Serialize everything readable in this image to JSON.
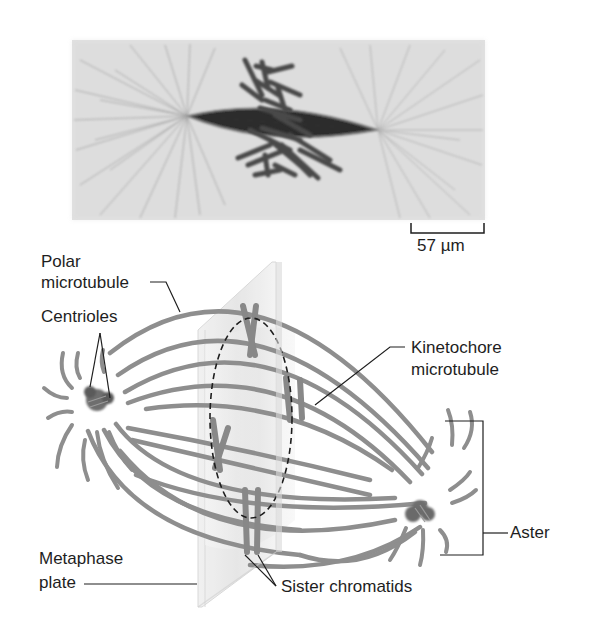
{
  "figure": {
    "micrograph": {
      "description": "Light micrograph of metaphase spindle with chromosomes at center",
      "scale_bar": {
        "label": "57 µm"
      }
    },
    "labels": {
      "polar_microtubule": [
        "Polar",
        "microtubule"
      ],
      "centrioles": "Centrioles",
      "kinetochore_microtubule": [
        "Kinetochore",
        "microtubule"
      ],
      "aster": "Aster",
      "metaphase_plate": [
        "Metaphase",
        "plate"
      ],
      "sister_chromatids": "Sister chromatids"
    },
    "colors": {
      "microtubule": "#8c8c8c",
      "chromosome": "#8a8a8a",
      "centrosome": "#6e6e6e",
      "plate": "#e6e6e6",
      "leader_line": "#1e1e1e",
      "text": "#1e1e1e"
    }
  }
}
